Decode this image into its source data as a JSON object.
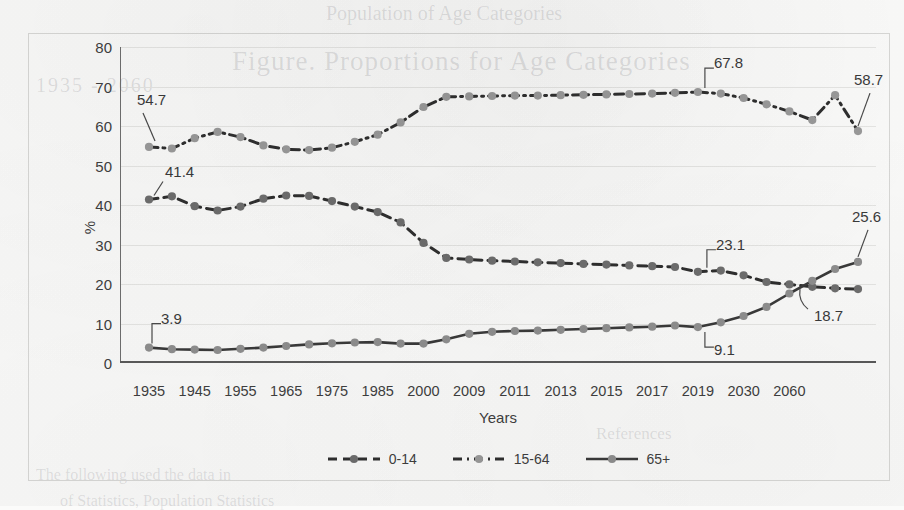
{
  "chart_data": {
    "type": "line",
    "title": "",
    "xlabel": "Years",
    "ylabel": "%",
    "ylim": [
      0,
      80
    ],
    "ytick_step": 10,
    "yticks": [
      "0",
      "10",
      "20",
      "30",
      "40",
      "50",
      "60",
      "70",
      "80"
    ],
    "grid": true,
    "legend_position": "bottom",
    "x": [
      "1935",
      "1940",
      "1945",
      "1950",
      "1955",
      "1960",
      "1965",
      "1970",
      "1975",
      "1980",
      "1985",
      "1990",
      "2000",
      "2005",
      "2009",
      "2010",
      "2011",
      "2012",
      "2013",
      "2014",
      "2015",
      "2016",
      "2017",
      "2018",
      "2019",
      "2020",
      "2025",
      "2030",
      "2040",
      "2050",
      "2060",
      "2070"
    ],
    "xticks": [
      "1935",
      "1945",
      "1955",
      "1965",
      "1975",
      "1985",
      "2000",
      "2009",
      "2011",
      "2013",
      "2015",
      "2017",
      "2019",
      "2030",
      "2060"
    ],
    "series": [
      {
        "name": "0-14",
        "style": "dashed",
        "color": "#6e6e6e",
        "values": [
          41.4,
          42.2,
          39.7,
          38.6,
          39.6,
          41.6,
          42.4,
          42.3,
          41.0,
          39.6,
          38.2,
          35.6,
          30.4,
          26.6,
          26.2,
          25.9,
          25.7,
          25.5,
          25.3,
          25.1,
          24.9,
          24.7,
          24.5,
          24.3,
          23.1,
          23.4,
          22.2,
          20.5,
          19.9,
          19.3,
          18.9,
          18.7
        ]
      },
      {
        "name": "15-64",
        "style": "dash-dot",
        "color": "#9a9a9a",
        "values": [
          54.7,
          54.3,
          56.9,
          58.5,
          57.2,
          55.1,
          54.1,
          53.9,
          54.5,
          56.0,
          57.8,
          60.9,
          64.8,
          67.4,
          67.5,
          67.6,
          67.7,
          67.7,
          67.8,
          67.9,
          68.0,
          68.1,
          68.2,
          68.4,
          68.6,
          68.2,
          67.1,
          65.5,
          63.7,
          61.5,
          67.8,
          58.7
        ]
      },
      {
        "name": "65+",
        "style": "solid",
        "color": "#8f8f8f",
        "values": [
          3.9,
          3.5,
          3.4,
          3.3,
          3.6,
          3.9,
          4.3,
          4.7,
          5.0,
          5.2,
          5.3,
          4.9,
          4.9,
          6.0,
          7.4,
          7.9,
          8.1,
          8.2,
          8.4,
          8.6,
          8.8,
          9.0,
          9.2,
          9.5,
          9.1,
          10.3,
          11.9,
          14.2,
          17.6,
          20.8,
          23.8,
          25.6
        ]
      }
    ],
    "annotations": [
      {
        "id": "ann-54-7",
        "text": "54.7",
        "series": "15-64",
        "value": 54.7
      },
      {
        "id": "ann-41-4",
        "text": "41.4",
        "series": "0-14",
        "value": 41.4
      },
      {
        "id": "ann-3-9",
        "text": "3.9",
        "series": "65+",
        "value": 3.9
      },
      {
        "id": "ann-67-8",
        "text": "67.8",
        "series": "15-64",
        "value": 67.8
      },
      {
        "id": "ann-58-7",
        "text": "58.7",
        "series": "15-64",
        "value": 58.7
      },
      {
        "id": "ann-23-1",
        "text": "23.1",
        "series": "0-14",
        "value": 23.1
      },
      {
        "id": "ann-25-6",
        "text": "25.6",
        "series": "65+",
        "value": 25.6
      },
      {
        "id": "ann-18-7",
        "text": "18.7",
        "series": "0-14",
        "value": 18.7
      },
      {
        "id": "ann-9-1",
        "text": "9.1",
        "series": "65+",
        "value": 9.1
      }
    ],
    "legend": [
      {
        "label": "0-14",
        "style": "dashed"
      },
      {
        "label": "15-64",
        "style": "dash-dot"
      },
      {
        "label": "65+",
        "style": "solid"
      }
    ]
  },
  "ghost_text": {
    "title": "Figure. Proportions for Age Categories",
    "top": "Population of Age Categories",
    "mid": "1935 - 2060",
    "low1": "References",
    "low2": "The following used the data in",
    "low3": "of Statistics, Population Statistics"
  }
}
